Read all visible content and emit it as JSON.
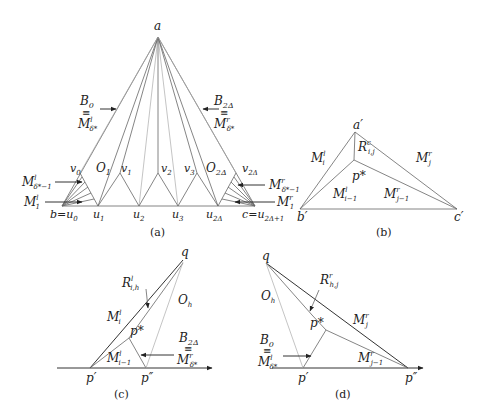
{
  "panels": {
    "a": {
      "caption": "(a)",
      "apex": "a",
      "left_corner": "b=u",
      "left_corner_sub": "0",
      "right_corner": "c=u",
      "right_corner_sub": "2Δ+1",
      "bottom_vertices": [
        {
          "base": "u",
          "sub": "1"
        },
        {
          "base": "u",
          "sub": "2"
        },
        {
          "base": "u",
          "sub": "3"
        },
        {
          "base": "u",
          "sub": "2Δ"
        }
      ],
      "top_vertices": [
        {
          "base": "v",
          "sub": "0"
        },
        {
          "base": "v",
          "sub": "1"
        },
        {
          "base": "v",
          "sub": "2"
        },
        {
          "base": "v",
          "sub": "3"
        },
        {
          "base": "v",
          "sub": "2Δ"
        }
      ],
      "regions": [
        {
          "base": "O",
          "sub": "1"
        },
        {
          "base": "O",
          "sub": "2Δ"
        }
      ],
      "left_boundary": {
        "top": "B",
        "top_sub": "0",
        "equiv": "≡",
        "bottom": "M",
        "bottom_sup": "l",
        "bottom_sub": "δ*"
      },
      "right_boundary": {
        "top": "B",
        "top_sub": "2Δ",
        "equiv": "≡",
        "bottom": "M",
        "bottom_sup": "r",
        "bottom_sub": "δ*"
      },
      "left_fan_labels": [
        {
          "base": "M",
          "sup": "l",
          "sub": "δ*−1"
        },
        {
          "base": "M",
          "sup": "l",
          "sub": "1"
        }
      ],
      "right_fan_labels": [
        {
          "base": "M",
          "sup": "r",
          "sub": "δ*−1"
        },
        {
          "base": "M",
          "sup": "r",
          "sub": "1"
        }
      ]
    },
    "b": {
      "caption": "(b)",
      "apex": "a′",
      "left_corner": "b′",
      "right_corner": "c′",
      "inner_point": "p*",
      "labels": [
        {
          "base": "R",
          "sup": "c",
          "sub": "i,j"
        },
        {
          "base": "M",
          "sup": "l",
          "sub": "i"
        },
        {
          "base": "M",
          "sup": "r",
          "sub": "j"
        },
        {
          "base": "M",
          "sup": "l",
          "sub": "i−1"
        },
        {
          "base": "M",
          "sup": "r",
          "sub": "j−1"
        }
      ]
    },
    "c": {
      "caption": "(c)",
      "apex": "q",
      "left_point": "p′",
      "right_point": "p″",
      "inner_point": "p*",
      "region": {
        "base": "O",
        "sub": "h"
      },
      "labels": [
        {
          "base": "R",
          "sup": "l",
          "sub": "i,h"
        },
        {
          "base": "M",
          "sup": "l",
          "sub": "i"
        },
        {
          "base": "M",
          "sup": "l",
          "sub": "i−1"
        }
      ],
      "boundary": {
        "top": "B",
        "top_sub": "2Δ",
        "equiv": "≡",
        "bottom": "M",
        "bottom_sup": "r",
        "bottom_sub": "δ*"
      }
    },
    "d": {
      "caption": "(d)",
      "apex": "q",
      "left_point": "p′",
      "right_point": "p″",
      "inner_point": "p*",
      "region": {
        "base": "O",
        "sub": "h"
      },
      "labels": [
        {
          "base": "R",
          "sup": "r",
          "sub": "h,j"
        },
        {
          "base": "M",
          "sup": "r",
          "sub": "j"
        },
        {
          "base": "M",
          "sup": "r",
          "sub": "j−1"
        }
      ],
      "boundary": {
        "top": "B",
        "top_sub": "0",
        "equiv": "≡",
        "bottom": "M",
        "bottom_sup": "l",
        "bottom_sub": "δ*"
      }
    }
  },
  "colors": {
    "line_dark": "#333333",
    "line_mid": "#666666",
    "line_light": "#aaaaaa",
    "text": "#222222",
    "background": "#ffffff"
  }
}
